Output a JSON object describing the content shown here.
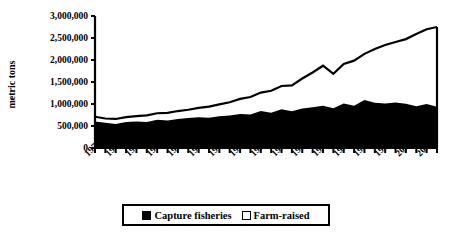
{
  "chart_data": {
    "type": "area",
    "title": "",
    "subtitle": "",
    "xlabel": "",
    "ylabel": "metric tons",
    "stacked": true,
    "grid": false,
    "legend_position": "bottom",
    "xlim": [
      1970,
      2003
    ],
    "ylim": [
      0,
      3000000
    ],
    "y_ticks": [
      0,
      500000,
      1000000,
      1500000,
      2000000,
      2500000,
      3000000
    ],
    "y_tick_labels": [
      "0",
      "500,000",
      "1,000,000",
      "1,500,000",
      "2,000,000",
      "2,500,000",
      "3,000,000"
    ],
    "x_tick_labels": [
      "1970",
      "1972",
      "1974",
      "1976",
      "1978",
      "1980",
      "1982",
      "1984",
      "1986",
      "1988",
      "1990",
      "1992",
      "1994",
      "1996",
      "1998",
      "2000",
      "2002"
    ],
    "x": [
      1970,
      1971,
      1972,
      1973,
      1974,
      1975,
      1976,
      1977,
      1978,
      1979,
      1980,
      1981,
      1982,
      1983,
      1984,
      1985,
      1986,
      1987,
      1988,
      1989,
      1990,
      1991,
      1992,
      1993,
      1994,
      1995,
      1996,
      1997,
      1998,
      1999,
      2000,
      2001,
      2002,
      2003
    ],
    "series": [
      {
        "name": "Capture fisheries",
        "color": "#000000",
        "values": [
          600000,
          575000,
          545000,
          590000,
          605000,
          590000,
          640000,
          625000,
          660000,
          680000,
          700000,
          690000,
          720000,
          740000,
          775000,
          760000,
          840000,
          800000,
          880000,
          835000,
          900000,
          925000,
          960000,
          905000,
          1010000,
          960000,
          1090000,
          1030000,
          1010000,
          1035000,
          1005000,
          950000,
          1000000,
          940000
        ]
      },
      {
        "name": "Farm-raised",
        "color": "#ffffff",
        "values": [
          110000,
          95000,
          115000,
          110000,
          120000,
          150000,
          150000,
          175000,
          180000,
          190000,
          210000,
          250000,
          270000,
          300000,
          340000,
          400000,
          420000,
          500000,
          530000,
          590000,
          680000,
          790000,
          910000,
          780000,
          900000,
          1025000,
          1050000,
          1220000,
          1330000,
          1375000,
          1470000,
          1640000,
          1700000,
          1810000
        ]
      }
    ],
    "total_values": [
      710000,
      670000,
      660000,
      700000,
      725000,
      740000,
      790000,
      800000,
      840000,
      870000,
      910000,
      940000,
      990000,
      1040000,
      1115000,
      1160000,
      1260000,
      1300000,
      1410000,
      1425000,
      1580000,
      1715000,
      1870000,
      1685000,
      1910000,
      1985000,
      2140000,
      2250000,
      2340000,
      2410000,
      2475000,
      2590000,
      2700000,
      2750000
    ]
  },
  "legend": {
    "items": [
      {
        "label": "Capture fisheries",
        "swatch": "filled"
      },
      {
        "label": "Farm-raised",
        "swatch": "hollow"
      }
    ]
  }
}
